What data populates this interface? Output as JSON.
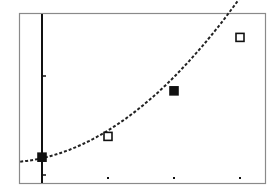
{
  "chart_data": {
    "type": "scatter",
    "title": "",
    "xlabel": "",
    "ylabel": "",
    "grid": false,
    "legend": null,
    "x": [
      0,
      1,
      2,
      3
    ],
    "series": [
      {
        "name": "data-points",
        "markers": [
          "filled-square",
          "open-square",
          "filled-square",
          "open-square"
        ],
        "x": [
          0,
          1,
          2,
          3
        ],
        "y": [
          0.18,
          0.39,
          0.85,
          1.39
        ]
      },
      {
        "name": "regression-curve",
        "style": "dotted-line",
        "x": [
          -0.33,
          0,
          1,
          2,
          3,
          3.3
        ],
        "y": [
          0.07,
          0.17,
          0.45,
          0.86,
          1.38,
          1.53
        ]
      }
    ],
    "x_ticks": [
      0,
      1,
      2,
      3
    ],
    "y_ticks": [
      0,
      1
    ],
    "xlim": [
      -0.35,
      3.45
    ],
    "ylim": [
      -0.08,
      1.63
    ],
    "tick_labels_shown": false
  },
  "style": {
    "frame_color": "#8a8a8a",
    "axis_color": "#111111",
    "point_color": "#111111",
    "curve_color": "#222222",
    "background": "#ffffff"
  }
}
